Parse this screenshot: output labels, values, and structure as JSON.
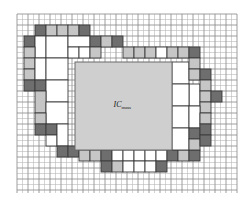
{
  "figure": {
    "type": "quadtree-grid-decomposition",
    "caption_label": "IC",
    "caption_subscript": "mass",
    "canvas": {
      "width": 251,
      "height": 204,
      "background": "#ffffff"
    },
    "grid": {
      "origin_x": 17,
      "origin_y": 14,
      "extent_x": 237,
      "extent_y": 193,
      "fine_cell_size": 5.5,
      "coarse_cell_size": 11,
      "fine_line_color": "#b9b9b9",
      "coarse_line_color": "#7d7d7d",
      "fine_line_width": 0.6,
      "coarse_line_width": 0.9
    },
    "colors": {
      "dark_cell": "#6e6e6e",
      "mid_cell": "#c6c6c6",
      "light_cell": "#ffffff",
      "interior_block": "#cfcfcf",
      "cell_border": "#3a3a3a",
      "interior_border": "#6b6b6b"
    },
    "interior_block": {
      "x": 75,
      "y": 62,
      "width": 97,
      "height": 88,
      "fill": "#cfcfcf",
      "stroke": "#6b6b6b"
    },
    "boundary_cells": [
      {
        "x": 35,
        "y": 25,
        "w": 11,
        "h": 11,
        "shade": "dark"
      },
      {
        "x": 46,
        "y": 25,
        "w": 11,
        "h": 11,
        "shade": "mid"
      },
      {
        "x": 57,
        "y": 25,
        "w": 11,
        "h": 11,
        "shade": "mid"
      },
      {
        "x": 68,
        "y": 25,
        "w": 11,
        "h": 11,
        "shade": "mid"
      },
      {
        "x": 79,
        "y": 25,
        "w": 11,
        "h": 11,
        "shade": "dark"
      },
      {
        "x": 24,
        "y": 36,
        "w": 11,
        "h": 11,
        "shade": "dark"
      },
      {
        "x": 35,
        "y": 36,
        "w": 11,
        "h": 22,
        "shade": "light"
      },
      {
        "x": 46,
        "y": 36,
        "w": 22,
        "h": 22,
        "shade": "light"
      },
      {
        "x": 68,
        "y": 36,
        "w": 22,
        "h": 11,
        "shade": "light"
      },
      {
        "x": 90,
        "y": 36,
        "w": 11,
        "h": 11,
        "shade": "dark"
      },
      {
        "x": 101,
        "y": 36,
        "w": 11,
        "h": 11,
        "shade": "mid"
      },
      {
        "x": 112,
        "y": 36,
        "w": 11,
        "h": 11,
        "shade": "dark"
      },
      {
        "x": 68,
        "y": 47,
        "w": 11,
        "h": 11,
        "shade": "light"
      },
      {
        "x": 79,
        "y": 47,
        "w": 11,
        "h": 11,
        "shade": "light"
      },
      {
        "x": 90,
        "y": 47,
        "w": 11,
        "h": 11,
        "shade": "mid"
      },
      {
        "x": 123,
        "y": 47,
        "w": 11,
        "h": 11,
        "shade": "mid"
      },
      {
        "x": 134,
        "y": 47,
        "w": 11,
        "h": 11,
        "shade": "mid"
      },
      {
        "x": 145,
        "y": 47,
        "w": 11,
        "h": 11,
        "shade": "mid"
      },
      {
        "x": 156,
        "y": 47,
        "w": 11,
        "h": 11,
        "shade": "light"
      },
      {
        "x": 167,
        "y": 47,
        "w": 11,
        "h": 11,
        "shade": "mid"
      },
      {
        "x": 178,
        "y": 47,
        "w": 11,
        "h": 11,
        "shade": "mid"
      },
      {
        "x": 189,
        "y": 47,
        "w": 11,
        "h": 11,
        "shade": "dark"
      },
      {
        "x": 24,
        "y": 47,
        "w": 11,
        "h": 11,
        "shade": "mid"
      },
      {
        "x": 24,
        "y": 58,
        "w": 11,
        "h": 11,
        "shade": "mid"
      },
      {
        "x": 24,
        "y": 69,
        "w": 11,
        "h": 11,
        "shade": "mid"
      },
      {
        "x": 24,
        "y": 80,
        "w": 11,
        "h": 11,
        "shade": "dark"
      },
      {
        "x": 35,
        "y": 58,
        "w": 11,
        "h": 22,
        "shade": "light"
      },
      {
        "x": 35,
        "y": 80,
        "w": 11,
        "h": 11,
        "shade": "dark"
      },
      {
        "x": 46,
        "y": 58,
        "w": 22,
        "h": 22,
        "shade": "light"
      },
      {
        "x": 46,
        "y": 80,
        "w": 22,
        "h": 22,
        "shade": "light"
      },
      {
        "x": 35,
        "y": 91,
        "w": 11,
        "h": 22,
        "shade": "mid"
      },
      {
        "x": 46,
        "y": 102,
        "w": 22,
        "h": 22,
        "shade": "light"
      },
      {
        "x": 35,
        "y": 113,
        "w": 11,
        "h": 11,
        "shade": "mid"
      },
      {
        "x": 35,
        "y": 124,
        "w": 11,
        "h": 11,
        "shade": "dark"
      },
      {
        "x": 46,
        "y": 124,
        "w": 11,
        "h": 11,
        "shade": "dark"
      },
      {
        "x": 46,
        "y": 135,
        "w": 11,
        "h": 11,
        "shade": "light"
      },
      {
        "x": 57,
        "y": 124,
        "w": 11,
        "h": 22,
        "shade": "light"
      },
      {
        "x": 57,
        "y": 146,
        "w": 11,
        "h": 11,
        "shade": "dark"
      },
      {
        "x": 68,
        "y": 146,
        "w": 11,
        "h": 11,
        "shade": "dark"
      },
      {
        "x": 79,
        "y": 150,
        "w": 11,
        "h": 11,
        "shade": "mid"
      },
      {
        "x": 90,
        "y": 150,
        "w": 11,
        "h": 11,
        "shade": "mid"
      },
      {
        "x": 101,
        "y": 150,
        "w": 11,
        "h": 11,
        "shade": "dark"
      },
      {
        "x": 112,
        "y": 150,
        "w": 11,
        "h": 11,
        "shade": "light"
      },
      {
        "x": 123,
        "y": 150,
        "w": 11,
        "h": 11,
        "shade": "light"
      },
      {
        "x": 134,
        "y": 150,
        "w": 11,
        "h": 11,
        "shade": "light"
      },
      {
        "x": 145,
        "y": 150,
        "w": 11,
        "h": 11,
        "shade": "light"
      },
      {
        "x": 156,
        "y": 150,
        "w": 11,
        "h": 11,
        "shade": "light"
      },
      {
        "x": 167,
        "y": 150,
        "w": 11,
        "h": 11,
        "shade": "dark"
      },
      {
        "x": 178,
        "y": 150,
        "w": 11,
        "h": 11,
        "shade": "mid"
      },
      {
        "x": 189,
        "y": 150,
        "w": 11,
        "h": 11,
        "shade": "dark"
      },
      {
        "x": 101,
        "y": 161,
        "w": 11,
        "h": 11,
        "shade": "dark"
      },
      {
        "x": 112,
        "y": 161,
        "w": 11,
        "h": 11,
        "shade": "mid"
      },
      {
        "x": 123,
        "y": 161,
        "w": 11,
        "h": 11,
        "shade": "light"
      },
      {
        "x": 134,
        "y": 161,
        "w": 11,
        "h": 11,
        "shade": "light"
      },
      {
        "x": 145,
        "y": 161,
        "w": 11,
        "h": 11,
        "shade": "light"
      },
      {
        "x": 156,
        "y": 161,
        "w": 11,
        "h": 11,
        "shade": "dark"
      },
      {
        "x": 172,
        "y": 62,
        "w": 17,
        "h": 22,
        "shade": "light"
      },
      {
        "x": 189,
        "y": 58,
        "w": 11,
        "h": 11,
        "shade": "mid"
      },
      {
        "x": 189,
        "y": 69,
        "w": 11,
        "h": 11,
        "shade": "mid"
      },
      {
        "x": 200,
        "y": 69,
        "w": 11,
        "h": 11,
        "shade": "dark"
      },
      {
        "x": 189,
        "y": 84,
        "w": 11,
        "h": 22,
        "shade": "light"
      },
      {
        "x": 200,
        "y": 80,
        "w": 11,
        "h": 11,
        "shade": "mid"
      },
      {
        "x": 200,
        "y": 91,
        "w": 11,
        "h": 11,
        "shade": "mid"
      },
      {
        "x": 200,
        "y": 102,
        "w": 11,
        "h": 11,
        "shade": "mid"
      },
      {
        "x": 211,
        "y": 91,
        "w": 11,
        "h": 11,
        "shade": "dark"
      },
      {
        "x": 172,
        "y": 84,
        "w": 17,
        "h": 22,
        "shade": "light"
      },
      {
        "x": 172,
        "y": 106,
        "w": 17,
        "h": 22,
        "shade": "light"
      },
      {
        "x": 189,
        "y": 106,
        "w": 11,
        "h": 22,
        "shade": "light"
      },
      {
        "x": 200,
        "y": 113,
        "w": 11,
        "h": 11,
        "shade": "mid"
      },
      {
        "x": 172,
        "y": 128,
        "w": 17,
        "h": 22,
        "shade": "light"
      },
      {
        "x": 189,
        "y": 128,
        "w": 11,
        "h": 11,
        "shade": "dark"
      },
      {
        "x": 200,
        "y": 124,
        "w": 11,
        "h": 11,
        "shade": "dark"
      },
      {
        "x": 189,
        "y": 139,
        "w": 11,
        "h": 11,
        "shade": "mid"
      },
      {
        "x": 200,
        "y": 135,
        "w": 11,
        "h": 11,
        "shade": "dark"
      }
    ]
  }
}
